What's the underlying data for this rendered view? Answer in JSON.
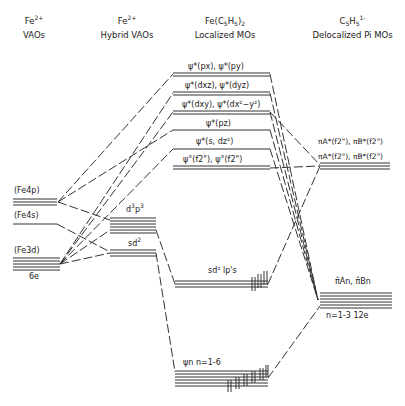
{
  "columns": [
    {
      "line1": "Fe",
      "line1_sup": "2+",
      "line2": "VAOs"
    },
    {
      "line1": "Fe",
      "line1_sup": "2+",
      "line2": "Hybrid VAOs"
    },
    {
      "line1": "Fe(C",
      "line1_sub1": "5",
      "line1_mid": "H",
      "line1_sub2": "5",
      "line1_end": ")",
      "line1_sub3": "2",
      "line2": "Localized MOs"
    },
    {
      "line1": "C",
      "line1_sub1": "5",
      "line1_mid": "H",
      "line1_sub2": "5",
      "line1_sup": "1-",
      "line2": "Delocalized Pi MOs"
    }
  ],
  "fe_vaos": {
    "fe4p": "(Fe4p)",
    "fe4s": "(Fe4s)",
    "fe3d": "(Fe3d)",
    "fe3d_electrons": "6e"
  },
  "hybrids": {
    "d3p3": "d",
    "d3p3_sup1": "3",
    "d3p3_mid": "p",
    "d3p3_sup2": "3",
    "sd2": "sd",
    "sd2_sup": "2"
  },
  "localized_mos": {
    "px_py": "ψ*(px), ψ*(py)",
    "dxz_dyz": "ψ*(dxz), ψ*(dyz)",
    "dxy_dx2y2": "ψ*(dxy), ψ*(dx²−y²)",
    "pz": "ψ*(pz)",
    "s_dz2": "ψ*(s, dz²)",
    "f2": "ψ°(f2\"), ψ°(f2\")",
    "sd2_lps": "sd² lp's",
    "psi_n": "ψn  n=1-6"
  },
  "cp_mos": {
    "pi_star_upper": "πA*(f2\"), πB*(f2\")",
    "pi_star_lower": "πA*(f2\"), πB*(f2\")",
    "pi_bonding": "π̂An, π̂Bn",
    "pi_bonding_count": "n=1-3 12e"
  }
}
